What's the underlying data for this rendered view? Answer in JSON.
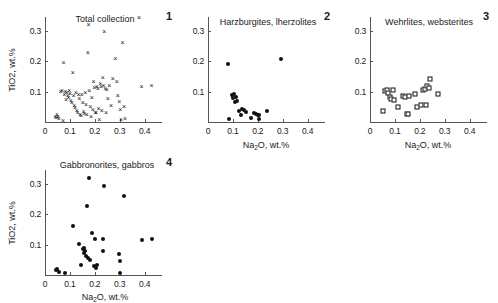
{
  "figure": {
    "axis_x_label": "Na2O, wt.%",
    "axis_y_label": "TiO2, wt.%",
    "x_ticks": [
      "0",
      "0.1",
      "0.2",
      "0.3",
      "0.4"
    ],
    "y_ticks": [
      "0.1",
      "0.2",
      "0.3"
    ],
    "marker_color": "#111111",
    "axis_color": "#555555"
  },
  "chart_data": [
    {
      "type": "scatter",
      "panel_number": "1",
      "title": "Total collection",
      "marker": "cross",
      "xlabel": "Na2O, wt.%",
      "ylabel": "TiO2, wt.%",
      "xlim": [
        0,
        0.47
      ],
      "ylim": [
        0,
        0.345
      ],
      "xticks": [
        0,
        0.1,
        0.2,
        0.3,
        0.4
      ],
      "yticks": [
        0.1,
        0.2,
        0.3
      ],
      "grid": false,
      "points": [
        [
          0.041,
          0.018
        ],
        [
          0.044,
          0.012
        ],
        [
          0.048,
          0.022
        ],
        [
          0.052,
          0.016
        ],
        [
          0.055,
          0.009
        ],
        [
          0.062,
          0.097
        ],
        [
          0.068,
          0.101
        ],
        [
          0.072,
          0.004
        ],
        [
          0.075,
          0.193
        ],
        [
          0.078,
          0.09
        ],
        [
          0.082,
          0.099
        ],
        [
          0.085,
          0.073
        ],
        [
          0.088,
          0.096
        ],
        [
          0.092,
          0.086
        ],
        [
          0.095,
          0.079
        ],
        [
          0.098,
          0.102
        ],
        [
          0.101,
          0.091
        ],
        [
          0.104,
          0.07
        ],
        [
          0.108,
          0.061
        ],
        [
          0.112,
          0.161
        ],
        [
          0.115,
          0.084
        ],
        [
          0.118,
          0.052
        ],
        [
          0.121,
          0.046
        ],
        [
          0.124,
          0.096
        ],
        [
          0.128,
          0.035
        ],
        [
          0.131,
          0.028
        ],
        [
          0.135,
          0.09
        ],
        [
          0.138,
          0.075
        ],
        [
          0.141,
          0.024
        ],
        [
          0.145,
          0.019
        ],
        [
          0.148,
          0.088
        ],
        [
          0.152,
          0.063
        ],
        [
          0.155,
          0.033
        ],
        [
          0.158,
          0.026
        ],
        [
          0.162,
          0.095
        ],
        [
          0.165,
          0.055
        ],
        [
          0.168,
          0.022
        ],
        [
          0.172,
          0.227
        ],
        [
          0.175,
          0.318
        ],
        [
          0.178,
          0.101
        ],
        [
          0.182,
          0.048
        ],
        [
          0.185,
          0.015
        ],
        [
          0.188,
          0.079
        ],
        [
          0.192,
          0.038
        ],
        [
          0.195,
          0.132
        ],
        [
          0.198,
          0.112
        ],
        [
          0.202,
          0.031
        ],
        [
          0.205,
          0.028
        ],
        [
          0.208,
          0.116
        ],
        [
          0.212,
          0.108
        ],
        [
          0.215,
          0.043
        ],
        [
          0.218,
          0.005
        ],
        [
          0.222,
          0.124
        ],
        [
          0.225,
          0.114
        ],
        [
          0.228,
          0.036
        ],
        [
          0.232,
          0.143
        ],
        [
          0.235,
          0.119
        ],
        [
          0.238,
          0.295
        ],
        [
          0.242,
          0.108
        ],
        [
          0.245,
          0.031
        ],
        [
          0.248,
          0.104
        ],
        [
          0.252,
          0.077
        ],
        [
          0.258,
          0.117
        ],
        [
          0.265,
          0.051
        ],
        [
          0.272,
          0.142
        ],
        [
          0.282,
          0.208
        ],
        [
          0.288,
          0.13
        ],
        [
          0.292,
          0.084
        ],
        [
          0.298,
          0.067
        ],
        [
          0.302,
          0.04
        ],
        [
          0.305,
          0.007
        ],
        [
          0.312,
          0.258
        ],
        [
          0.318,
          0.048
        ],
        [
          0.322,
          0.01
        ],
        [
          0.388,
          0.116
        ],
        [
          0.428,
          0.117
        ]
      ]
    },
    {
      "type": "scatter",
      "panel_number": "2",
      "title": "Harzburgites, lherzolites",
      "marker": "dot",
      "xlabel": "Na2O, wt.%",
      "ylabel": "TiO2, wt.%",
      "xlim": [
        0,
        0.47
      ],
      "ylim": [
        0,
        0.345
      ],
      "xticks": [
        0,
        0.1,
        0.2,
        0.3,
        0.4
      ],
      "yticks": [
        0.1,
        0.2,
        0.3
      ],
      "grid": false,
      "points": [
        [
          0.081,
          0.19
        ],
        [
          0.086,
          0.01
        ],
        [
          0.096,
          0.09
        ],
        [
          0.101,
          0.079
        ],
        [
          0.104,
          0.092
        ],
        [
          0.108,
          0.066
        ],
        [
          0.112,
          0.083
        ],
        [
          0.118,
          0.068
        ],
        [
          0.125,
          0.036
        ],
        [
          0.131,
          0.022
        ],
        [
          0.138,
          0.043
        ],
        [
          0.145,
          0.04
        ],
        [
          0.152,
          0.033
        ],
        [
          0.172,
          0.012
        ],
        [
          0.185,
          0.028
        ],
        [
          0.192,
          0.026
        ],
        [
          0.199,
          0.022
        ],
        [
          0.203,
          0.023
        ],
        [
          0.206,
          0.01
        ],
        [
          0.238,
          0.036
        ],
        [
          0.293,
          0.206
        ]
      ]
    },
    {
      "type": "scatter",
      "panel_number": "3",
      "title": "Wehrlites, websterites",
      "marker": "open-square",
      "xlabel": "Na2O, wt.%",
      "ylabel": "TiO2, wt.%",
      "xlim": [
        0,
        0.47
      ],
      "ylim": [
        0,
        0.345
      ],
      "xticks": [
        0,
        0.1,
        0.2,
        0.3,
        0.4
      ],
      "yticks": [
        0.1,
        0.2,
        0.3
      ],
      "grid": false,
      "points": [
        [
          0.053,
          0.036
        ],
        [
          0.061,
          0.101
        ],
        [
          0.069,
          0.105
        ],
        [
          0.074,
          0.096
        ],
        [
          0.079,
          0.081
        ],
        [
          0.086,
          0.075
        ],
        [
          0.091,
          0.106
        ],
        [
          0.095,
          0.071
        ],
        [
          0.112,
          0.05
        ],
        [
          0.134,
          0.084
        ],
        [
          0.141,
          0.083
        ],
        [
          0.147,
          0.026
        ],
        [
          0.152,
          0.026
        ],
        [
          0.158,
          0.084
        ],
        [
          0.181,
          0.093
        ],
        [
          0.189,
          0.049
        ],
        [
          0.205,
          0.056
        ],
        [
          0.212,
          0.104
        ],
        [
          0.219,
          0.108
        ],
        [
          0.224,
          0.055
        ],
        [
          0.228,
          0.117
        ],
        [
          0.237,
          0.113
        ],
        [
          0.241,
          0.14
        ],
        [
          0.272,
          0.093
        ]
      ]
    },
    {
      "type": "scatter",
      "panel_number": "4",
      "title": "Gabbronorites, gabbros",
      "marker": "dot",
      "xlabel": "Na2O, wt.%",
      "ylabel": "TiO2, wt.%",
      "xlim": [
        0,
        0.47
      ],
      "ylim": [
        0,
        0.345
      ],
      "xticks": [
        0,
        0.1,
        0.2,
        0.3,
        0.4
      ],
      "yticks": [
        0.1,
        0.2,
        0.3
      ],
      "grid": false,
      "points": [
        [
          0.043,
          0.016
        ],
        [
          0.05,
          0.019
        ],
        [
          0.058,
          0.009
        ],
        [
          0.081,
          0.006
        ],
        [
          0.112,
          0.16
        ],
        [
          0.138,
          0.102
        ],
        [
          0.145,
          0.032
        ],
        [
          0.152,
          0.085
        ],
        [
          0.156,
          0.072
        ],
        [
          0.158,
          0.09
        ],
        [
          0.162,
          0.079
        ],
        [
          0.165,
          0.062
        ],
        [
          0.168,
          0.226
        ],
        [
          0.172,
          0.055
        ],
        [
          0.176,
          0.318
        ],
        [
          0.182,
          0.05
        ],
        [
          0.188,
          0.139
        ],
        [
          0.196,
          0.03
        ],
        [
          0.202,
          0.118
        ],
        [
          0.205,
          0.022
        ],
        [
          0.208,
          0.033
        ],
        [
          0.232,
          0.118
        ],
        [
          0.234,
          0.079
        ],
        [
          0.236,
          0.292
        ],
        [
          0.298,
          0.068
        ],
        [
          0.301,
          0.046
        ],
        [
          0.303,
          0.008
        ],
        [
          0.318,
          0.258
        ],
        [
          0.388,
          0.116
        ],
        [
          0.428,
          0.117
        ]
      ]
    }
  ]
}
